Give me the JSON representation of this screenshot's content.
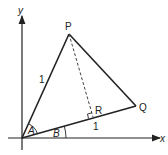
{
  "diagram": {
    "axes": {
      "x_label": "x",
      "y_label": "y"
    },
    "points": {
      "P": "P",
      "Q": "Q",
      "R": "R"
    },
    "side_labels": {
      "OP": "1",
      "OQ": "1"
    },
    "angle_labels": {
      "A": "A",
      "B": "B"
    },
    "colors": {
      "line": "#222222",
      "background": "#ffffff"
    }
  }
}
